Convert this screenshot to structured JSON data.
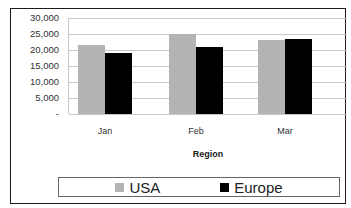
{
  "chart_data": {
    "type": "bar",
    "title": "",
    "xlabel": "Region",
    "ylabel": "",
    "categories": [
      "Jan",
      "Feb",
      "Mar"
    ],
    "series": [
      {
        "name": "USA",
        "color": "#b4b4b4",
        "values": [
          21500,
          25000,
          23000
        ]
      },
      {
        "name": "Europe",
        "color": "#000000",
        "values": [
          19000,
          21000,
          23500
        ]
      }
    ],
    "ylim": [
      0,
      30000
    ],
    "yticks": [
      0,
      5000,
      10000,
      15000,
      20000,
      25000,
      30000
    ],
    "ytick_labels": [
      "-",
      "5,000",
      "10,000",
      "15,000",
      "20,000",
      "25,000",
      "30,000"
    ],
    "grid": true,
    "legend_position": "bottom"
  }
}
